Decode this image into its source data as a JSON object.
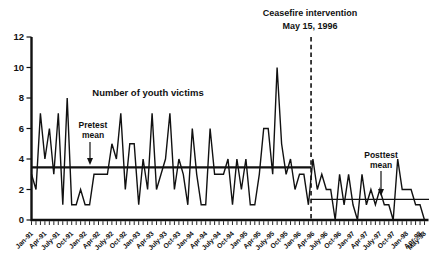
{
  "chart_data": {
    "type": "line",
    "series_label": "Number of youth victims",
    "x_start": "Jan-91",
    "x_end": "May-98",
    "x_tick_labels": [
      "Jan-91",
      "Apr-91",
      "July-91",
      "Oct-91",
      "Jan-92",
      "Apr-92",
      "July-92",
      "Oct-92",
      "Jan-93",
      "Apr-93",
      "July-93",
      "Oct-93",
      "Jan-94",
      "Apr-94",
      "July-94",
      "Oct-94",
      "Jan-95",
      "Apr-95",
      "July-95",
      "Oct-95",
      "Jan-96",
      "Apr-96",
      "July-96",
      "Oct-96",
      "Jan-97",
      "Apr-97",
      "July-97",
      "Oct-97",
      "Jan-98",
      "Apr-98",
      "May-98"
    ],
    "values": [
      3,
      2,
      7,
      4,
      6,
      3,
      7,
      1,
      8,
      1,
      1,
      2,
      1,
      1,
      3,
      3,
      3,
      3,
      5,
      4,
      7,
      2,
      5,
      5,
      1,
      4,
      2,
      7,
      2,
      3,
      4,
      7,
      2,
      4,
      3,
      1,
      6,
      3,
      1,
      1,
      6,
      3,
      3,
      3,
      4,
      1,
      4,
      2,
      4,
      1,
      1,
      3,
      6,
      6,
      3,
      10,
      5,
      3,
      4,
      2,
      3,
      3,
      1,
      4,
      2,
      3,
      2,
      2,
      0,
      3,
      1,
      3,
      1,
      0,
      3,
      1,
      2,
      1,
      2,
      1,
      1,
      0,
      4,
      2,
      2,
      2,
      1,
      1,
      0
    ],
    "ylim": [
      0,
      12
    ],
    "yticks": [
      0,
      2,
      4,
      6,
      8,
      10,
      12
    ],
    "grid": "off",
    "legend": "none",
    "pretest_mean": 3.45,
    "posttest_mean": 1.35,
    "pretest_label_line1": "Pretest",
    "pretest_label_line2": "mean",
    "posttest_label_line1": "Posttest",
    "posttest_label_line2": "mean",
    "intervention": {
      "line1": "Ceasefire intervention",
      "line2": "May 15, 1996",
      "month_index": 63
    },
    "line_color": "#111111",
    "background_color": "#ffffff"
  }
}
